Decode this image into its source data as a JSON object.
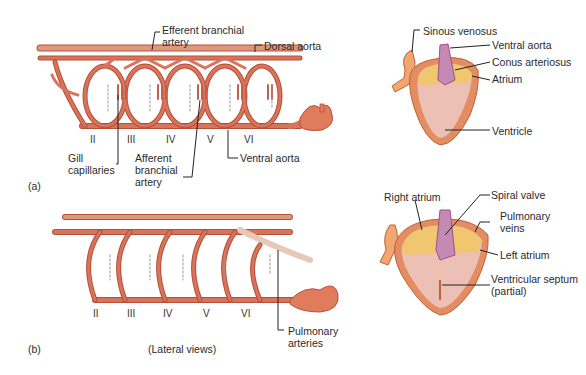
{
  "figure": {
    "panel_a": {
      "tag": "(a)",
      "arch_numerals": [
        "II",
        "III",
        "IV",
        "V",
        "VI"
      ],
      "labels": {
        "efferent_branchial_artery": "Efferent branchial artery",
        "dorsal_aorta": "Dorsal aorta",
        "gill_capillaries": "Gill capillaries",
        "afferent_branchial_artery": "Afferent branchial artery",
        "ventral_aorta": "Ventral aorta"
      },
      "heart_labels": {
        "sinous_venosus": "Sinous venosus",
        "ventral_aorta": "Ventral aorta",
        "conus_arteriosus": "Conus arteriosus",
        "atrium": "Atrium",
        "ventricle": "Ventricle"
      }
    },
    "panel_b": {
      "tag": "(b)",
      "caption": "(Lateral views)",
      "arch_numerals": [
        "II",
        "III",
        "IV",
        "V",
        "VI"
      ],
      "labels": {
        "pulmonary_arteries": "Pulmonary arteries"
      },
      "heart_labels": {
        "right_atrium": "Right atrium",
        "spiral_valve": "Spiral valve",
        "pulmonary_veins": "Pulmonary veins",
        "left_atrium": "Left atrium",
        "ventricular_septum": "Ventricular septum (partial)"
      }
    },
    "colors": {
      "vessel": "#d9745a",
      "vessel_dark": "#b4503a",
      "vessel_light": "#e8a690",
      "atrium_yellow": "#f0c66e",
      "conus_purple": "#c58ab4",
      "ventricle_pink": "#ecc0b4",
      "heart_wall": "#e48d62"
    }
  }
}
